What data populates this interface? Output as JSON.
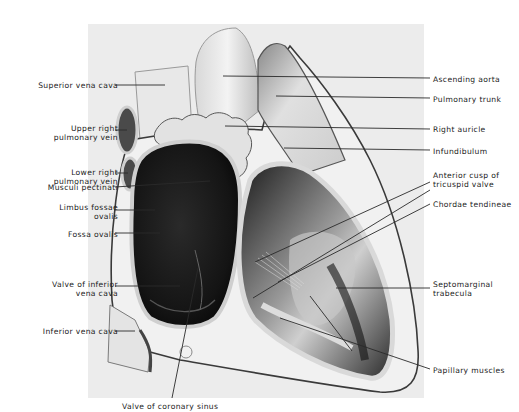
{
  "figure": {
    "type": "anatomical-illustration",
    "colors": {
      "background": "#ffffff",
      "panel": "#ececec",
      "chamber_dark": "#1e1e1e",
      "tissue_light": "#f4f4f4",
      "leader": "#2a2a2a"
    }
  },
  "labels_left": [
    {
      "text": "Superior vena cava",
      "x": 8,
      "y": 81,
      "w": 110,
      "line": [
        115,
        85,
        165,
        85
      ]
    },
    {
      "text": "Upper right\npulmonary vein",
      "x": 8,
      "y": 124,
      "w": 110,
      "line": [
        115,
        130,
        127,
        130
      ]
    },
    {
      "text": "Lower right\npulmonary vein",
      "x": 8,
      "y": 168,
      "w": 110,
      "line": [
        115,
        173,
        128,
        173
      ]
    },
    {
      "text": "Musculi pectinati",
      "x": 8,
      "y": 183,
      "w": 110,
      "line": [
        115,
        187,
        210,
        181
      ]
    },
    {
      "text": "Limbus fossae\novalis",
      "x": 8,
      "y": 203,
      "w": 110,
      "line": [
        115,
        210,
        155,
        210
      ]
    },
    {
      "text": "Fossa ovalis",
      "x": 8,
      "y": 230,
      "w": 110,
      "line": [
        115,
        233,
        160,
        233
      ]
    },
    {
      "text": "Valve of inferior\nvena cava",
      "x": 8,
      "y": 280,
      "w": 110,
      "line": [
        115,
        286,
        180,
        286
      ]
    },
    {
      "text": "Inferior vena cava",
      "x": 8,
      "y": 327,
      "w": 110,
      "line": [
        115,
        331,
        135,
        331
      ]
    }
  ],
  "labels_right": [
    {
      "text": "Ascending aorta",
      "x": 433,
      "y": 75,
      "w": 86,
      "line": [
        223,
        76,
        430,
        78
      ]
    },
    {
      "text": "Pulmonary trunk",
      "x": 433,
      "y": 95,
      "w": 86,
      "line": [
        276,
        96,
        430,
        98
      ]
    },
    {
      "text": "Right auricle",
      "x": 433,
      "y": 125,
      "w": 86,
      "line": [
        225,
        126,
        430,
        129
      ]
    },
    {
      "text": "Infundibulum",
      "x": 433,
      "y": 147,
      "w": 86,
      "line": [
        284,
        148,
        430,
        150
      ]
    },
    {
      "text": "Anterior cusp of\ntricuspid valve",
      "x": 433,
      "y": 171,
      "w": 86,
      "line": [
        255,
        262,
        430,
        182
      ]
    },
    {
      "text": "Chordae tendineae",
      "x": 433,
      "y": 200,
      "w": 86,
      "line": [
        278,
        282,
        430,
        204
      ]
    },
    {
      "text": "Septomarginal\ntrabecula",
      "x": 433,
      "y": 280,
      "w": 86,
      "line": [
        336,
        288,
        430,
        288
      ]
    },
    {
      "text": "Papillary muscles",
      "x": 433,
      "y": 366,
      "w": 86,
      "line": [
        280,
        318,
        430,
        369
      ]
    }
  ],
  "labels_bottom": [
    {
      "text": "Valve of coronary sinus",
      "x": 122,
      "y": 402,
      "w": 120,
      "line": [
        198,
        268,
        172,
        398
      ]
    }
  ],
  "extra_leaders": [
    [
      253,
      298,
      430,
      190
    ],
    [
      310,
      296,
      352,
      351
    ]
  ]
}
